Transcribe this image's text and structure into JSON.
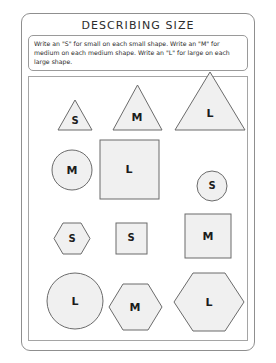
{
  "document": {
    "title": "DESCRIBING SIZE",
    "instructions": "Write an \"S\" for small on each small shape.  Write an \"M\" for medium on each medium shape.  Write an \"L\" for large on each large shape.",
    "colors": {
      "shape_fill": "#f0f0f0",
      "shape_stroke": "#6b6b6b",
      "border": "#8f8f8f",
      "text": "#2a2a2a"
    }
  },
  "shapes": [
    {
      "id": "triangle-small",
      "type": "triangle",
      "size": "small",
      "label": "S",
      "row": 1,
      "col": 1
    },
    {
      "id": "triangle-medium",
      "type": "triangle",
      "size": "medium",
      "label": "M",
      "row": 1,
      "col": 2
    },
    {
      "id": "triangle-large",
      "type": "triangle",
      "size": "large",
      "label": "L",
      "row": 1,
      "col": 3
    },
    {
      "id": "circle-medium",
      "type": "circle",
      "size": "medium",
      "label": "M",
      "row": 2,
      "col": 1
    },
    {
      "id": "square-large",
      "type": "square",
      "size": "large",
      "label": "L",
      "row": 2,
      "col": 2
    },
    {
      "id": "circle-small",
      "type": "circle",
      "size": "small",
      "label": "S",
      "row": 2,
      "col": 3
    },
    {
      "id": "hexagon-small",
      "type": "hexagon",
      "size": "small",
      "label": "S",
      "row": 3,
      "col": 1
    },
    {
      "id": "square-small",
      "type": "square",
      "size": "small",
      "label": "S",
      "row": 3,
      "col": 2
    },
    {
      "id": "square-medium",
      "type": "square",
      "size": "medium",
      "label": "M",
      "row": 3,
      "col": 3
    },
    {
      "id": "circle-large",
      "type": "circle",
      "size": "large",
      "label": "L",
      "row": 4,
      "col": 1
    },
    {
      "id": "hexagon-medium",
      "type": "hexagon",
      "size": "medium",
      "label": "M",
      "row": 4,
      "col": 2
    },
    {
      "id": "hexagon-large",
      "type": "hexagon",
      "size": "large",
      "label": "L",
      "row": 4,
      "col": 3
    }
  ]
}
